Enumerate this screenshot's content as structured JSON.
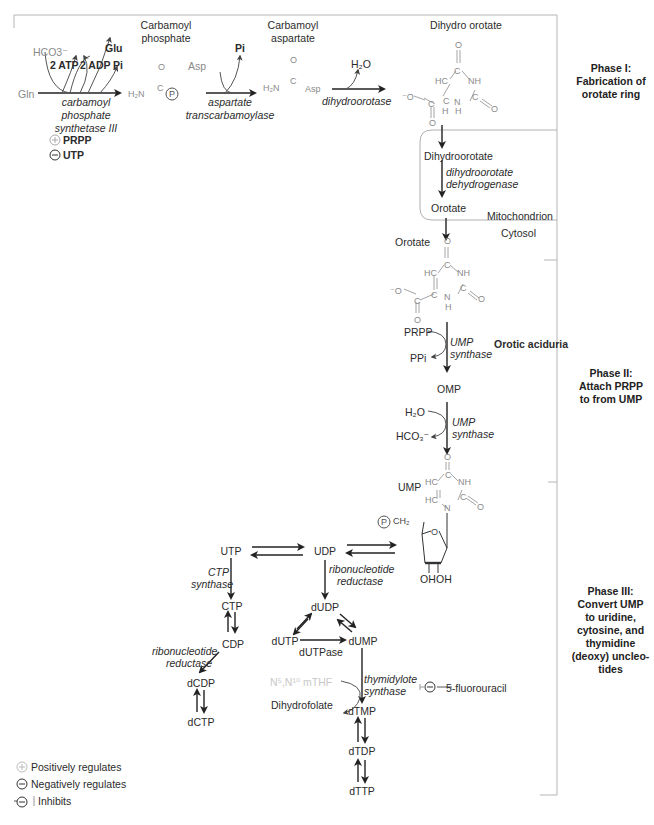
{
  "figure": {
    "type": "biochemical pathway diagram"
  },
  "phases": [
    {
      "id": "phase1",
      "label_line1": "Phase I:",
      "label_line2": "Fabrication of",
      "label_line3": "orotate ring"
    },
    {
      "id": "phase2",
      "label_line1": "Phase II:",
      "label_line2": "Attach PRPP",
      "label_line3": "to from UMP"
    },
    {
      "id": "phase3",
      "label_line1": "Phase III:",
      "label_line2": "Convert UMP",
      "label_line3": "to uridine,",
      "label_line4": "cytosine, and",
      "label_line5": "thymidine",
      "label_line6": "(deoxy) uncleo-",
      "label_line7": "tides"
    }
  ],
  "phase1": {
    "substrate": "Gln",
    "hco3": "HCO3⁻",
    "atp": "2 ATP",
    "adp": "2 ADP",
    "glu": "Glu",
    "pi": "Pi",
    "enzyme_cps_line1": "carbamoyl",
    "enzyme_cps_line2": "phosphate",
    "enzyme_cps_line3": "synthetase III",
    "reg_pos": "PRPP",
    "reg_neg": "UTP",
    "carbamoyl_phosphate_line1": "Carbamoyl",
    "carbamoyl_phosphate_line2": "phosphate",
    "cp_h2n": "H₂N",
    "cp_o": "O",
    "cp_c": "C",
    "cp_p": "P",
    "asp": "Asp",
    "pi2": "Pi",
    "enzyme_atc_line1": "aspartate",
    "enzyme_atc_line2": "transcarbamoylase",
    "carbamoyl_aspartate_line1": "Carbamoyl",
    "carbamoyl_aspartate_line2": "aspartate",
    "ca_h2n": "H₂N",
    "ca_asp": "Asp",
    "h2o": "H₂O",
    "enzyme_dho": "dihydroorotase",
    "dihydroorotate_title": "Dihydro orotate",
    "mito_dihydroorotate": "Dihydroorotate",
    "enzyme_dhodh_line1": "dihydroorotate",
    "enzyme_dhodh_line2": "dehydrogenase",
    "mito_orotate": "Orotate",
    "mitochondrion": "Mitochondrion",
    "cytosol": "Cytosol"
  },
  "phase2": {
    "orotate": "Orotate",
    "prpp": "PRPP",
    "ppi": "PPi",
    "enzyme1_line1": "UMP",
    "enzyme1_line2": "synthase",
    "disease": "Orotic aciduria",
    "omp": "OMP",
    "h2o": "H₂O",
    "hco3": "HCO₃⁻",
    "enzyme2_line1": "UMP",
    "enzyme2_line2": "synthase",
    "ump": "UMP",
    "ribose_p": "P",
    "ch2": "CH₂",
    "ring_o": "O",
    "oh1": "OH",
    "oh2": "OH"
  },
  "phase3": {
    "utp": "UTP",
    "udp": "UDP",
    "ctp_synthase_line1": "CTP",
    "ctp_synthase_line2": "synthase",
    "ctp": "CTP",
    "cdp": "CDP",
    "rnr_left_line1": "ribonucleotide",
    "rnr_left_line2": "reductase",
    "dcdp": "dCDP",
    "dctp": "dCTP",
    "rnr_right_line1": "ribonucleotide",
    "rnr_right_line2": "reductase",
    "dudp": "dUDP",
    "dutp": "dUTP",
    "dump": "dUMP",
    "dutpase": "dUTPase",
    "methylene_thf": "N⁵,N¹⁰ mTHF",
    "dihydrofolate": "Dihydrofolate",
    "ts_line1": "thymidylote",
    "ts_line2": "synthase",
    "inhibitor": "5-fluorouracil",
    "dtmp": "dTMP",
    "dtdp": "dTDP",
    "dttp": "dTTP"
  },
  "legend": {
    "positive": "Positively regulates",
    "negative": "Negatively regulates",
    "inhibits": "Inhibits"
  },
  "colors": {
    "text": "#2b2b2b",
    "structure_gray": "#8a8a8a",
    "light_gray": "#c8c8c8",
    "frame": "#b5b5b5",
    "arrow": "#222222"
  }
}
